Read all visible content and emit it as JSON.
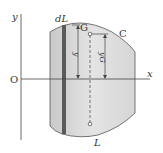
{
  "diagram": {
    "labels": {
      "origin": "O",
      "x_axis": "x",
      "y_axis": "y",
      "strip": "dL",
      "centroid": "G",
      "curve": "C",
      "region": "L",
      "y_dim": "y",
      "yG_dim": "yG"
    },
    "colors": {
      "region_fill": "#d9d9d9",
      "strip_fill": "#5a5a5a",
      "line": "#444444"
    }
  }
}
